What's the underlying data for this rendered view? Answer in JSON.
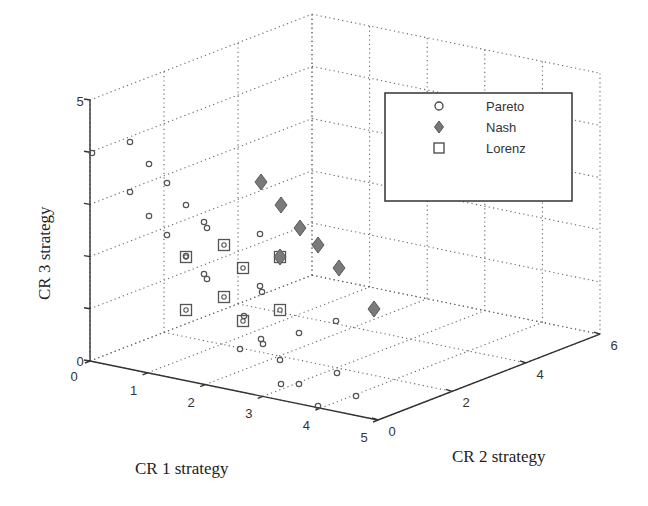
{
  "chart_data": {
    "type": "scatter3d",
    "title": "",
    "xlabel": "CR 1 strategy",
    "ylabel": "CR 2 strategy",
    "zlabel": "CR 3 strategy",
    "xlim": [
      0,
      5
    ],
    "ylim": [
      0,
      6
    ],
    "zlim": [
      0,
      5
    ],
    "xticks": [
      "0",
      "1",
      "2",
      "3",
      "4",
      "5"
    ],
    "yticks": [
      "0",
      "2",
      "4",
      "6"
    ],
    "zticks": [
      "0",
      "5"
    ],
    "grid": true,
    "legend_position": "upper right",
    "series": [
      {
        "name": "Pareto",
        "marker": "circle",
        "color": "#555555",
        "points": [
          [
            0,
            0,
            4
          ],
          [
            0,
            0,
            3
          ],
          [
            0,
            0,
            2
          ],
          [
            0,
            0,
            1
          ],
          [
            1,
            0,
            4
          ],
          [
            1,
            0,
            3
          ],
          [
            1,
            0,
            2
          ],
          [
            0,
            2,
            4
          ],
          [
            0,
            2,
            3
          ],
          [
            0,
            2,
            2
          ],
          [
            2,
            0,
            3
          ],
          [
            2,
            0,
            2
          ],
          [
            2,
            0,
            1
          ],
          [
            1,
            2,
            3
          ],
          [
            1,
            2,
            2
          ],
          [
            1,
            2,
            1
          ],
          [
            3,
            0,
            1
          ],
          [
            3,
            0,
            0
          ],
          [
            2,
            2,
            1
          ],
          [
            2,
            2,
            0
          ],
          [
            3,
            2,
            0
          ],
          [
            4,
            0,
            0
          ],
          [
            4,
            2,
            0
          ],
          [
            3,
            4,
            0
          ],
          [
            0,
            4,
            2
          ],
          [
            1,
            4,
            1
          ],
          [
            2,
            4,
            0
          ],
          [
            4,
            4,
            0
          ]
        ]
      },
      {
        "name": "Nash",
        "marker": "diamond",
        "color": "#777777",
        "points": [
          [
            0,
            4,
            4
          ],
          [
            0.5,
            4.5,
            3.5
          ],
          [
            1,
            5,
            3
          ],
          [
            1.5,
            5.5,
            2.5
          ],
          [
            2,
            6,
            2
          ],
          [
            1,
            4,
            2
          ],
          [
            3,
            6,
            0
          ]
        ]
      },
      {
        "name": "Lorenz",
        "marker": "square",
        "color": "#555555",
        "points": [
          [
            1,
            1,
            2
          ],
          [
            1,
            1,
            1
          ],
          [
            1.5,
            2,
            2
          ],
          [
            1.5,
            2,
            1
          ],
          [
            2,
            3,
            2
          ],
          [
            2,
            3,
            1
          ],
          [
            2.5,
            3.5,
            1
          ],
          [
            2.5,
            2,
            1
          ]
        ]
      }
    ]
  },
  "legend": {
    "items": [
      {
        "label": "Pareto",
        "marker": "circle"
      },
      {
        "label": "Nash",
        "marker": "diamond"
      },
      {
        "label": "Lorenz",
        "marker": "square"
      }
    ]
  },
  "axes": {
    "x_label": "CR 1 strategy",
    "y_label": "CR 2 strategy",
    "z_label": "CR 3 strategy",
    "x_ticks": [
      "0",
      "1",
      "2",
      "3",
      "4",
      "5"
    ],
    "y_ticks": [
      "0",
      "2",
      "4",
      "6"
    ],
    "z_ticks": [
      "0",
      "5"
    ]
  },
  "pixel_markers": {
    "pareto": [
      [
        92,
        153
      ],
      [
        130,
        142
      ],
      [
        149,
        164
      ],
      [
        130,
        192
      ],
      [
        149,
        216
      ],
      [
        167,
        183
      ],
      [
        167,
        235
      ],
      [
        186,
        205
      ],
      [
        186,
        256
      ],
      [
        204,
        222
      ],
      [
        207,
        228
      ],
      [
        204,
        274
      ],
      [
        207,
        279
      ],
      [
        260,
        234
      ],
      [
        260,
        286
      ],
      [
        262,
        292
      ],
      [
        244,
        316
      ],
      [
        240,
        349
      ],
      [
        261,
        339
      ],
      [
        263,
        344
      ],
      [
        280,
        360
      ],
      [
        299,
        384
      ],
      [
        281,
        384
      ],
      [
        299,
        333
      ],
      [
        336,
        321
      ],
      [
        337,
        373
      ],
      [
        356,
        396
      ],
      [
        318,
        406
      ]
    ],
    "nash": [
      [
        261,
        182
      ],
      [
        281,
        205
      ],
      [
        300,
        228
      ],
      [
        318,
        245
      ],
      [
        339,
        268
      ],
      [
        280,
        257
      ],
      [
        374,
        309
      ]
    ],
    "lorenz": [
      [
        186,
        257
      ],
      [
        224,
        245
      ],
      [
        243,
        268
      ],
      [
        224,
        297
      ],
      [
        186,
        310
      ],
      [
        243,
        321
      ],
      [
        280,
        310
      ],
      [
        280,
        257
      ]
    ]
  }
}
